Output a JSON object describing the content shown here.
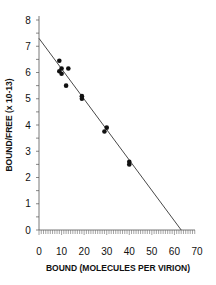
{
  "chart_data": {
    "type": "scatter",
    "title": "",
    "xlabel": "BOUND (MOLECULES PER VIRION)",
    "ylabel": "BOUND/FREE (x 10-13)",
    "xlim": [
      0,
      70
    ],
    "ylim": [
      0,
      8
    ],
    "xticks": [
      0,
      10,
      20,
      30,
      40,
      50,
      60,
      70
    ],
    "yticks": [
      0,
      1,
      2,
      3,
      4,
      5,
      6,
      7,
      8
    ],
    "grid": false,
    "legend": null,
    "series": [
      {
        "name": "data",
        "kind": "scatter",
        "points": [
          {
            "x": 9,
            "y": 6.45
          },
          {
            "x": 9,
            "y": 6.05
          },
          {
            "x": 10,
            "y": 5.95
          },
          {
            "x": 10,
            "y": 6.15
          },
          {
            "x": 12,
            "y": 5.5
          },
          {
            "x": 13,
            "y": 6.15
          },
          {
            "x": 19,
            "y": 5.1
          },
          {
            "x": 19,
            "y": 5.0
          },
          {
            "x": 29,
            "y": 3.75
          },
          {
            "x": 30,
            "y": 3.9
          },
          {
            "x": 40,
            "y": 2.5
          },
          {
            "x": 40,
            "y": 2.6
          }
        ]
      },
      {
        "name": "linear fit",
        "kind": "line",
        "points": [
          {
            "x": 0,
            "y": 7.3
          },
          {
            "x": 63,
            "y": 0
          }
        ]
      }
    ]
  }
}
